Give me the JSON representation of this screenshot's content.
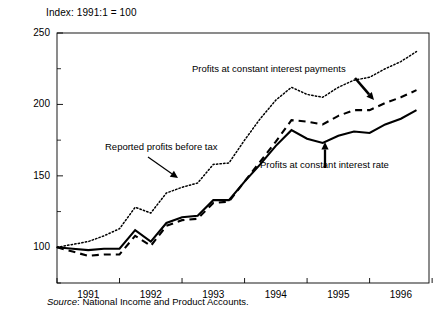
{
  "figure": {
    "index_note": "Index:  1991:1 = 100",
    "source_prefix": "Source",
    "source_sep": ": ",
    "source_text": "National Income and Product Accounts."
  },
  "annotations": {
    "dotted": "Profits at constant interest payments",
    "solid_left": "Reported profits before tax",
    "solid_right": "Profits at constant interest rate"
  },
  "chart_data": {
    "type": "line",
    "title": "Index:  1991:1 = 100",
    "xlabel": "",
    "ylabel": "",
    "ylim": [
      75,
      250
    ],
    "yticks": [
      100,
      150,
      200,
      250
    ],
    "yticks_minor": [
      75,
      125,
      175,
      225
    ],
    "xlim": [
      1991.0,
      1996.95
    ],
    "xticks": [
      1991,
      1992,
      1993,
      1994,
      1995,
      1996,
      1997
    ],
    "xtick_labels": [
      "1991",
      "1992",
      "1993",
      "1994",
      "1995",
      "1996"
    ],
    "grid": false,
    "legend": "annotations-with-arrows",
    "x": [
      1991.0,
      1991.25,
      1991.5,
      1991.75,
      1992.0,
      1992.25,
      1992.5,
      1992.75,
      1993.0,
      1993.25,
      1993.5,
      1993.75,
      1994.0,
      1994.25,
      1994.5,
      1994.75,
      1995.0,
      1995.25,
      1995.5,
      1995.75,
      1996.0,
      1996.25,
      1996.5,
      1996.75
    ],
    "series": [
      {
        "name": "Reported profits before tax",
        "style": "solid",
        "values": [
          100,
          99,
          98,
          99,
          99,
          112,
          104,
          117,
          121,
          122,
          133,
          133,
          146,
          158,
          171,
          182,
          176,
          173,
          178,
          181,
          180,
          186,
          190,
          196
        ]
      },
      {
        "name": "Profits at constant interest rate",
        "style": "dashed",
        "values": [
          100,
          97,
          94,
          95,
          95,
          108,
          101,
          115,
          119,
          120,
          131,
          132,
          146,
          160,
          174,
          189,
          188,
          186,
          192,
          196,
          196,
          201,
          205,
          210
        ]
      },
      {
        "name": "Profits at constant interest payments",
        "style": "dotted",
        "values": [
          100,
          102,
          104,
          108,
          113,
          128,
          124,
          138,
          142,
          145,
          158,
          159,
          175,
          190,
          203,
          212,
          207,
          205,
          212,
          217,
          219,
          225,
          230,
          237
        ]
      }
    ]
  },
  "axes": {
    "y_labels": [
      "250",
      "200",
      "150",
      "100"
    ],
    "x_labels": [
      "1991",
      "1992",
      "1993",
      "1994",
      "1995",
      "1996"
    ]
  }
}
